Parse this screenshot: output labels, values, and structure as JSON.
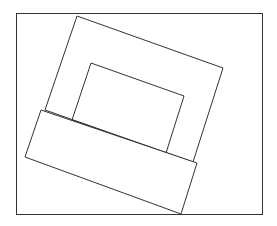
{
  "diagram": {
    "canvas": {
      "width": 277,
      "height": 226,
      "background": "#ffffff",
      "stroke": "#333333"
    },
    "frame": {
      "x": 16.5,
      "y": 13.5,
      "width": 246,
      "height": 201
    },
    "outer_square": {
      "points": "77,16 223,68 193,162 45,110"
    },
    "inner_rect": {
      "points": "91,63 184,96 166,153 72,120"
    },
    "base_rect": {
      "points": "41,110 197,163 181,214 25,157"
    }
  }
}
